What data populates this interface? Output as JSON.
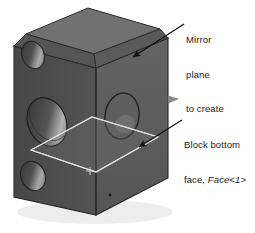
{
  "figure": {
    "type": "isometric-cad-block",
    "background_color": "#ffffff"
  },
  "annotations": {
    "mirror": {
      "line1": "Mirror",
      "line2": "plane",
      "line3": "to create",
      "arrow_name": "mirror-plane-leader-arrow"
    },
    "bottom_face": {
      "line1": "Block bottom",
      "line2_prefix": "face, ",
      "line2_reference": "Face<1>",
      "arrow_name": "bottom-face-leader-arrow"
    }
  },
  "colors": {
    "face_front": "#5d5d5d",
    "face_left": "#4a4a4a",
    "face_top": "#666666",
    "face_top_rib": "#707070",
    "face_rib_side": "#505050",
    "plane_fill": "#6a6a6a",
    "plane_edge": "#d8d8d8",
    "hole_dark": "#3a3a3a",
    "hole_highlight": "#9a9a9a",
    "outline": "#2a2a2a",
    "text": "#1a1a1a",
    "arrow": "#111111",
    "shadow": "#e8e8e8",
    "tab_marker": "#8a8a8a"
  },
  "geometry": {
    "holes": [
      {
        "name": "upper-left-small-hole",
        "cx": 33,
        "cy": 55,
        "rx": 11,
        "ry": 14,
        "rotation": -22
      },
      {
        "name": "left-large-hole",
        "cx": 47,
        "cy": 122,
        "rx": 19,
        "ry": 25,
        "rotation": -22
      },
      {
        "name": "lower-left-small-hole",
        "cx": 33,
        "cy": 176,
        "rx": 12,
        "ry": 15,
        "rotation": -22
      },
      {
        "name": "front-face-hole",
        "cx": 122,
        "cy": 116,
        "rx": 17,
        "ry": 23,
        "rotation": 8
      }
    ],
    "mirror_plane_center_mark": {
      "name": "plane-origin-cross",
      "x": 90,
      "y": 171
    }
  }
}
